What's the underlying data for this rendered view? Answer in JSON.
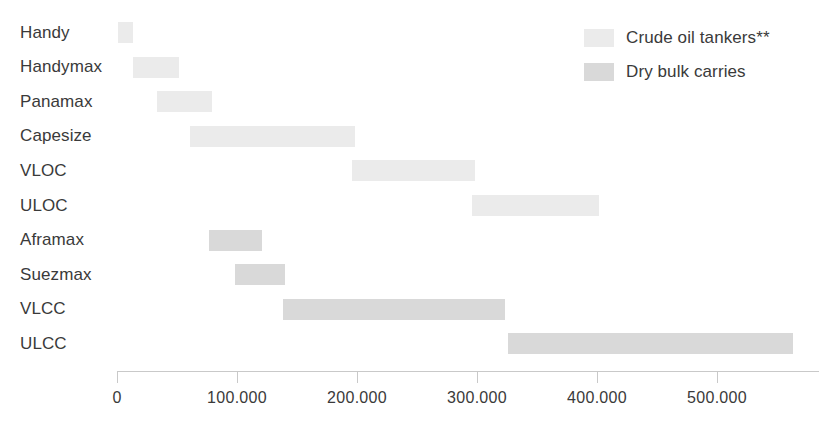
{
  "chart_data": {
    "type": "bar",
    "subtype": "horizontal-range-bar",
    "title": "",
    "subtitle": "",
    "xlabel": "",
    "ylabel": "",
    "xlim": [
      0,
      585000
    ],
    "xticks": [
      0,
      100000,
      200000,
      300000,
      400000,
      500000
    ],
    "xtick_labels": [
      "0",
      "100.000",
      "200.000",
      "300.000",
      "400.000",
      "500.000"
    ],
    "grid": false,
    "legend_position": "top-right",
    "categories": [
      "Handy",
      "Handymax",
      "Panamax",
      "Capesize",
      "VLOC",
      "ULOC",
      "Aframax",
      "Suezmax",
      "VLCC",
      "ULCC"
    ],
    "series": [
      {
        "name": "Crude oil tankers**",
        "color": "#ebebeb",
        "categories": [
          "Handy",
          "Handymax",
          "Panamax",
          "Capesize",
          "VLOC",
          "ULOC"
        ],
        "ranges": [
          {
            "category": "Handy",
            "start": 1000,
            "end": 13000
          },
          {
            "category": "Handymax",
            "start": 13000,
            "end": 52000
          },
          {
            "category": "Panamax",
            "start": 33000,
            "end": 79000
          },
          {
            "category": "Capesize",
            "start": 61000,
            "end": 198000
          },
          {
            "category": "VLOC",
            "start": 196000,
            "end": 298000
          },
          {
            "category": "ULOC",
            "start": 296000,
            "end": 402000
          }
        ]
      },
      {
        "name": "Dry bulk carries",
        "color": "#d9d9d9",
        "categories": [
          "Aframax",
          "Suezmax",
          "VLCC",
          "ULCC"
        ],
        "ranges": [
          {
            "category": "Aframax",
            "start": 77000,
            "end": 121000
          },
          {
            "category": "Suezmax",
            "start": 98000,
            "end": 140000
          },
          {
            "category": "VLCC",
            "start": 138000,
            "end": 323000
          },
          {
            "category": "ULCC",
            "start": 326000,
            "end": 563000
          }
        ]
      }
    ]
  },
  "legend": {
    "items": [
      {
        "label": "Crude oil tankers**",
        "color": "#ebebeb",
        "swatch": "light"
      },
      {
        "label": "Dry bulk carries",
        "color": "#d9d9d9",
        "swatch": "dark"
      }
    ]
  },
  "axis": {
    "ticks": [
      {
        "value": 0,
        "label": "0"
      },
      {
        "value": 100000,
        "label": "100.000"
      },
      {
        "value": 200000,
        "label": "200.000"
      },
      {
        "value": 300000,
        "label": "300.000"
      },
      {
        "value": 400000,
        "label": "400.000"
      },
      {
        "value": 500000,
        "label": "500.000"
      }
    ],
    "line_color": "#c9c9c9"
  },
  "categories": [
    {
      "label": "Handy"
    },
    {
      "label": "Handymax"
    },
    {
      "label": "Panamax"
    },
    {
      "label": "Capesize"
    },
    {
      "label": "VLOC"
    },
    {
      "label": "ULOC"
    },
    {
      "label": "Aframax"
    },
    {
      "label": "Suezmax"
    },
    {
      "label": "VLCC"
    },
    {
      "label": "ULCC"
    }
  ]
}
